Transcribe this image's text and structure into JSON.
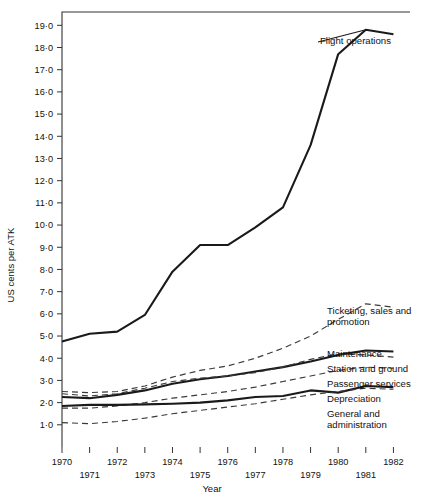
{
  "chart_data": {
    "type": "line",
    "title": "",
    "xlabel": "Year",
    "ylabel": "US cents  per  ATK",
    "x": [
      1970,
      1971,
      1972,
      1973,
      1974,
      1975,
      1976,
      1977,
      1978,
      1979,
      1980,
      1981,
      1982
    ],
    "xlim": [
      1970,
      1982.6
    ],
    "ylim": [
      0,
      19.6
    ],
    "ytick_labels": [
      "1·0",
      "2·0",
      "3·0",
      "4·0",
      "5·0",
      "6·0",
      "7·0",
      "8·0",
      "9·0",
      "10·0",
      "11·0",
      "12·0",
      "13·0",
      "14·0",
      "15·0",
      "16·0",
      "17·0",
      "18·0",
      "19·0"
    ],
    "ytick_values": [
      1,
      2,
      3,
      4,
      5,
      6,
      7,
      8,
      9,
      10,
      11,
      12,
      13,
      14,
      15,
      16,
      17,
      18,
      19
    ],
    "xtick_labels_upper": [
      "1970",
      "1972",
      "1974",
      "1976",
      "1978",
      "1980",
      "1982"
    ],
    "xtick_values_upper": [
      1970,
      1972,
      1974,
      1976,
      1978,
      1980,
      1982
    ],
    "xtick_labels_lower": [
      "1971",
      "1973",
      "1975",
      "1977",
      "1979",
      "1981"
    ],
    "xtick_values_lower": [
      1971,
      1973,
      1975,
      1977,
      1979,
      1981
    ],
    "grid": false,
    "legend": "inline-right-annotations",
    "series": [
      {
        "name": "Flight operations",
        "style": "solid",
        "values": [
          4.75,
          5.1,
          5.2,
          5.95,
          7.9,
          9.1,
          9.1,
          9.9,
          10.8,
          13.6,
          17.7,
          18.8,
          18.6
        ]
      },
      {
        "name": "Ticketing, sales and promotion",
        "style": "dashed",
        "values": [
          2.5,
          2.45,
          2.5,
          2.75,
          3.15,
          3.45,
          3.65,
          4.0,
          4.45,
          5.0,
          5.75,
          6.45,
          6.3
        ]
      },
      {
        "name": "Maintenance",
        "style": "solid",
        "values": [
          2.25,
          2.2,
          2.35,
          2.55,
          2.85,
          3.05,
          3.2,
          3.4,
          3.6,
          3.85,
          4.15,
          4.35,
          4.3
        ]
      },
      {
        "name": "Station and ground",
        "style": "dashed",
        "values": [
          2.4,
          2.3,
          2.4,
          2.65,
          2.95,
          3.1,
          3.2,
          3.35,
          3.6,
          3.95,
          4.2,
          4.15,
          4.05
        ]
      },
      {
        "name": "Passenger services",
        "style": "dashed",
        "values": [
          1.75,
          1.75,
          1.85,
          2.0,
          2.2,
          2.35,
          2.5,
          2.7,
          2.95,
          3.2,
          3.45,
          3.6,
          3.55
        ]
      },
      {
        "name": "Depreciation",
        "style": "solid",
        "values": [
          1.85,
          1.9,
          1.9,
          1.92,
          1.95,
          2.0,
          2.1,
          2.25,
          2.3,
          2.55,
          2.45,
          2.75,
          2.7
        ]
      },
      {
        "name": "General and administration",
        "style": "dashed",
        "values": [
          1.1,
          1.05,
          1.15,
          1.3,
          1.5,
          1.65,
          1.8,
          1.95,
          2.15,
          2.35,
          2.5,
          2.65,
          2.6
        ]
      }
    ],
    "annotations": [
      {
        "text": "Flight operations",
        "series": "Flight operations"
      },
      {
        "text": "Ticketing, sales and\npromotion",
        "series": "Ticketing, sales and promotion"
      },
      {
        "text": "Maintenance",
        "series": "Maintenance"
      },
      {
        "text": "Station and ground",
        "series": "Station and ground"
      },
      {
        "text": "Passenger services",
        "series": "Passenger services"
      },
      {
        "text": "Depreciation",
        "series": "Depreciation"
      },
      {
        "text": "General and\nadministration",
        "series": "General and administration"
      }
    ]
  },
  "labels": {
    "y_axis_title": "US cents  per  ATK",
    "x_axis_title": "Year",
    "flight_operations": "Flight operations",
    "ticketing": "Ticketing, sales and\npromotion",
    "maintenance": "Maintenance",
    "station_ground": "Station and ground",
    "passenger_services": "Passenger services",
    "depreciation": "Depreciation",
    "general_admin": "General and\nadministration"
  },
  "colors": {
    "line": "#1a1a1a",
    "dashed_line": "#3a3a3a",
    "axis": "#333333",
    "background": "#ffffff"
  }
}
